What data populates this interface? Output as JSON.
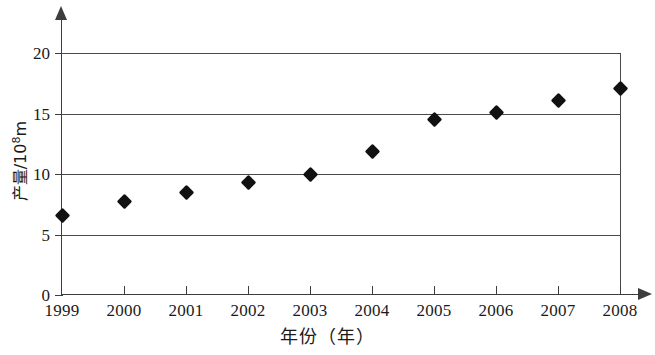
{
  "chart_data": {
    "type": "scatter",
    "title": "",
    "xlabel": "年份（年）",
    "ylabel": "产量/10⁸m",
    "ylabel_base": "产量/10",
    "ylabel_exp": "8",
    "ylabel_unit": "m",
    "categories": [
      "1999",
      "2000",
      "2001",
      "2002",
      "2003",
      "2004",
      "2005",
      "2006",
      "2007",
      "2008"
    ],
    "values": [
      6.6,
      7.7,
      8.5,
      9.3,
      10.0,
      11.9,
      14.5,
      15.1,
      16.1,
      17.1
    ],
    "x": [
      1999,
      2000,
      2001,
      2002,
      2003,
      2004,
      2005,
      2006,
      2007,
      2008
    ],
    "xlim": [
      1999,
      2008
    ],
    "ylim": [
      0,
      20
    ],
    "yticks": [
      0,
      5,
      10,
      15,
      20
    ],
    "ytick_labels": [
      "0",
      "5",
      "10",
      "15",
      "20"
    ],
    "xtick_labels": [
      "1999",
      "2000",
      "2001",
      "2002",
      "2003",
      "2004",
      "2005",
      "2006",
      "2007",
      "2008"
    ],
    "grid": "horizontal",
    "gridlines_at": [
      5,
      10,
      15,
      20
    ],
    "legend": null,
    "legend_position": "none",
    "marker": "diamond",
    "marker_color": "#111111",
    "axis_color": "#3d3d3d",
    "grid_color": "#4a4a4a",
    "background": "#ffffff",
    "annotations": []
  }
}
